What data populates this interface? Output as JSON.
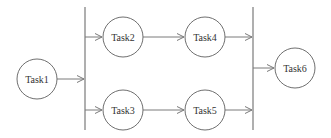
{
  "diagram": {
    "type": "task-dependency-graph",
    "nodes": [
      {
        "id": "task1",
        "label": "Task1"
      },
      {
        "id": "task2",
        "label": "Task2"
      },
      {
        "id": "task3",
        "label": "Task3"
      },
      {
        "id": "task4",
        "label": "Task4"
      },
      {
        "id": "task5",
        "label": "Task5"
      },
      {
        "id": "task6",
        "label": "Task6"
      }
    ],
    "edges": [
      {
        "from": "task1",
        "to": "fork-bar"
      },
      {
        "from": "fork-bar",
        "to": "task2"
      },
      {
        "from": "fork-bar",
        "to": "task3"
      },
      {
        "from": "task2",
        "to": "task4"
      },
      {
        "from": "task3",
        "to": "task5"
      },
      {
        "from": "task4",
        "to": "join-bar"
      },
      {
        "from": "task5",
        "to": "join-bar"
      },
      {
        "from": "join-bar",
        "to": "task6"
      }
    ],
    "colors": {
      "stroke": "#6f6f6f",
      "text": "#333333",
      "background": "#ffffff"
    }
  }
}
